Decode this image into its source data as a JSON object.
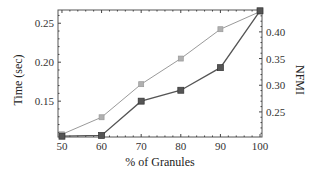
{
  "chart_data": {
    "type": "line",
    "title": "",
    "xlabel": "% of Granules",
    "ylabel": "Time (sec)",
    "ylabel_right": "NFMI",
    "x": [
      50,
      60,
      70,
      80,
      90,
      100
    ],
    "x_ticks": [
      "50",
      "60",
      "70",
      "80",
      "90",
      "100"
    ],
    "y_ticks_left": [
      "0.15",
      "0.20",
      "0.25"
    ],
    "y_ticks_right": [
      "0.25",
      "0.30",
      "0.35",
      "0.40"
    ],
    "ylim_left": [
      0.104,
      0.267
    ],
    "ylim_right": [
      0.203,
      0.441
    ],
    "xlim": [
      49,
      100.5
    ],
    "grid": false,
    "legend": null,
    "series": [
      {
        "name": "Time (sec)",
        "axis": "left",
        "color": "#555555",
        "marker": "square",
        "values": [
          0.105,
          0.106,
          0.15,
          0.164,
          0.193,
          0.266
        ]
      },
      {
        "name": "NFMI",
        "axis": "right",
        "color": "#9a9a9a",
        "marker": "square",
        "values": [
          0.208,
          0.24,
          0.302,
          0.35,
          0.405,
          0.438
        ]
      }
    ]
  }
}
